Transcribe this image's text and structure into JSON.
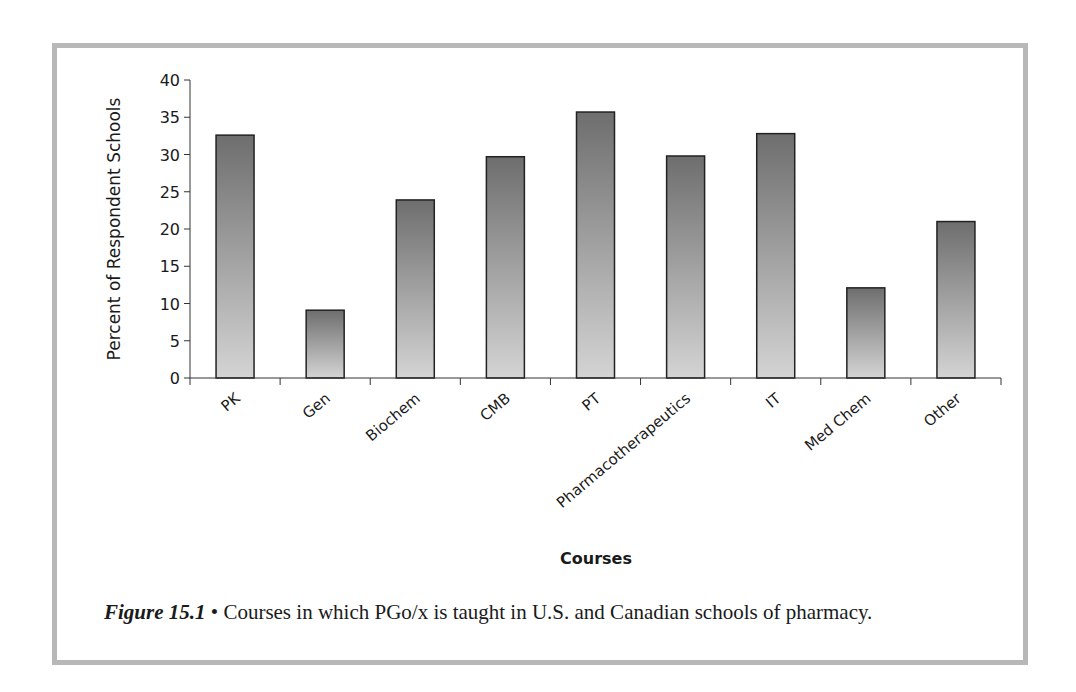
{
  "chart_data": {
    "type": "bar",
    "title": "",
    "xlabel": "Courses",
    "ylabel": "Percent of Respondent Schools",
    "ylim": [
      0,
      40
    ],
    "yticks": [
      0,
      5,
      10,
      15,
      20,
      25,
      30,
      35,
      40
    ],
    "grid": false,
    "legend": null,
    "categories": [
      "PK",
      "Gen",
      "Biochem",
      "CMB",
      "PT",
      "Pharmacotherapeutics",
      "IT",
      "Med Chem",
      "Other"
    ],
    "values": [
      32.6,
      9.1,
      23.9,
      29.7,
      35.7,
      29.8,
      32.8,
      12.1,
      21.0
    ]
  },
  "caption": {
    "figure_label": "Figure 15.1",
    "bullet": "•",
    "text": "Courses in which PGo/x is taught in U.S. and Canadian schools of pharmacy."
  },
  "colors": {
    "frame": "#b8b8b8",
    "bar_top": "#6e6e6e",
    "bar_bottom": "#d4d4d4",
    "bar_border": "#222222",
    "axis": "#333333"
  }
}
